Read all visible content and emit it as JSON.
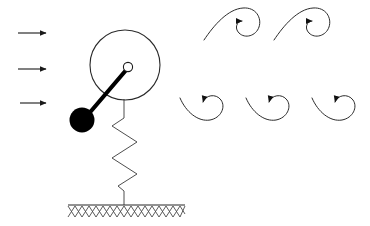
{
  "figure": {
    "background_color": "#ffffff",
    "line_color": "#262626",
    "fill_color": "#000000",
    "width": 370,
    "height": 226
  },
  "flow_arrows": {
    "name": "incoming-flow-arrows",
    "count": 3,
    "direction": "right",
    "color": "#2a2a2a",
    "items": [
      {
        "label": "flow-arrow-1",
        "x1": 18,
        "y1": 33,
        "x2": 48,
        "y2": 33
      },
      {
        "label": "flow-arrow-2",
        "x1": 18,
        "y1": 69,
        "x2": 48,
        "y2": 69
      },
      {
        "label": "flow-arrow-3",
        "x1": 20,
        "y1": 103,
        "x2": 48,
        "y2": 103
      }
    ]
  },
  "oscillator": {
    "disk": {
      "label": "cylinder-body",
      "cx": 125,
      "cy": 65,
      "r": 35,
      "color": "#2a2a2a"
    },
    "hub": {
      "label": "pivot-hub",
      "cx": 128,
      "cy": 67,
      "r": 4.5,
      "fill": "#ffffff",
      "stroke": "#1a1a1a"
    },
    "arm": {
      "label": "pendulum-arm",
      "x1": 127,
      "y1": 68,
      "x2": 86,
      "y2": 116,
      "color": "#000000"
    },
    "bob": {
      "label": "pendulum-mass",
      "cx": 82,
      "cy": 120,
      "r": 12.5,
      "fill": "#000000"
    }
  },
  "spring": {
    "label": "support-spring",
    "top_x": 124,
    "top_y": 100,
    "bottom_y": 205,
    "coils": 3,
    "amplitude": 14,
    "color": "#3a3a3a"
  },
  "ground": {
    "label": "fixed-ground",
    "x1": 68,
    "x2": 185,
    "y": 205,
    "hatch_depth": 11,
    "hatch_count": 17,
    "hatch_style": "cross-hatch",
    "color": "#4a4a4a"
  },
  "vortices": {
    "name": "shed-vortices",
    "color": "#2b2b2b",
    "top_row": {
      "label": "upper-vortex-row",
      "count": 2,
      "cy": 22,
      "rotation_sense": "clockwise",
      "items": [
        {
          "label": "vortex-top-1",
          "cx": 237,
          "cy": 22
        },
        {
          "label": "vortex-top-2",
          "cx": 307,
          "cy": 22
        }
      ]
    },
    "bottom_row": {
      "label": "lower-vortex-row",
      "count": 3,
      "cy": 106,
      "rotation_sense": "clockwise",
      "items": [
        {
          "label": "vortex-bottom-1",
          "cx": 210,
          "cy": 106
        },
        {
          "label": "vortex-bottom-2",
          "cx": 277,
          "cy": 106
        },
        {
          "label": "vortex-bottom-3",
          "cx": 343,
          "cy": 106
        }
      ]
    }
  }
}
